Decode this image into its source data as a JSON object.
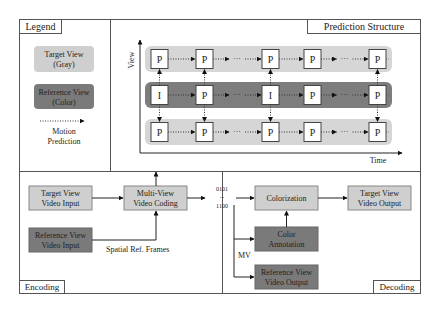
{
  "colors": {
    "target_gray": "#cfcfcf",
    "reference_dark": "#7a7a7a",
    "band_light": "#d6d6d6",
    "band_dark": "#7d7d7d",
    "frame": "#555555",
    "frame_box_fill": "#ffffff"
  },
  "legend": {
    "title": "Legend",
    "target_view": [
      "Target View",
      "(Gray)"
    ],
    "reference_view": [
      "Reference View",
      "(Color)"
    ],
    "motion_prediction": [
      "Motion",
      "Prediction"
    ]
  },
  "prediction_structure": {
    "title": "Prediction Structure",
    "y_axis_label": "View",
    "x_axis_label": "Time",
    "rows": [
      {
        "type": "target",
        "frames": [
          "P",
          "P",
          "P",
          "P",
          "P"
        ]
      },
      {
        "type": "reference",
        "frames": [
          "I",
          "P",
          "I",
          "P",
          "P"
        ]
      },
      {
        "type": "target",
        "frames": [
          "P",
          "P",
          "P",
          "P",
          "P"
        ]
      }
    ],
    "ellipsis": "···"
  },
  "encoding": {
    "title": "Encoding",
    "target_input": [
      "Target View",
      "Video Input"
    ],
    "reference_input": [
      "Reference View",
      "Video Input"
    ],
    "multiview_coding": [
      "Multi-View",
      "Video Coding"
    ],
    "spatial_ref_label": "Spatial Ref. Frames"
  },
  "bitstream": [
    "0101",
    "...",
    "1100"
  ],
  "decoding": {
    "title": "Decoding",
    "colorization": "Colorization",
    "target_output": [
      "Target View",
      "Video Output"
    ],
    "color_annotation": [
      "Color",
      "Annotation"
    ],
    "reference_output": [
      "Reference View",
      "Video Output"
    ],
    "mv_label": "MV"
  }
}
